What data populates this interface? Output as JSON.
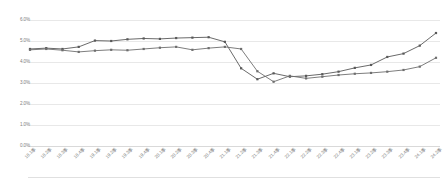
{
  "chart_data": {
    "type": "line",
    "title": "",
    "subtitle": "",
    "xlabel": "",
    "ylabel": "",
    "ylim": [
      0.0,
      6.0
    ],
    "yticks": [
      "6.0%",
      "5.0%",
      "4.0%",
      "3.0%",
      "2.0%",
      "1.0%",
      "0.0%"
    ],
    "ytick_values": [
      6.0,
      5.0,
      4.0,
      3.0,
      2.0,
      1.0,
      0.0
    ],
    "grid": true,
    "legend_position": "none",
    "categories": [
      "18.1季",
      "18.2季",
      "18.3季",
      "18.4季",
      "19.1季",
      "19.2季",
      "19.3季",
      "19.4季",
      "20.1季",
      "20.2季",
      "20.3季",
      "20.4季",
      "21.1季",
      "21.2季",
      "21.3季",
      "21.4季",
      "22.1季",
      "22.2季",
      "22.3季",
      "22.4季",
      "23.1季",
      "23.2季",
      "23.3季",
      "23.4季",
      "24.1季",
      "24.2季"
    ],
    "series": [
      {
        "name": "series-upper",
        "color": "#595959",
        "marker": "square",
        "values": [
          4.62,
          4.66,
          4.62,
          4.72,
          5.02,
          5.0,
          5.08,
          5.12,
          5.1,
          5.14,
          5.16,
          5.18,
          4.96,
          3.7,
          3.18,
          3.46,
          3.3,
          3.34,
          3.42,
          3.54,
          3.72,
          3.86,
          4.24,
          4.4,
          4.78,
          5.38
        ]
      },
      {
        "name": "series-lower",
        "color": "#6e6e6e",
        "marker": "square",
        "values": [
          4.58,
          4.62,
          4.56,
          4.48,
          4.54,
          4.58,
          4.56,
          4.62,
          4.68,
          4.72,
          4.58,
          4.66,
          4.72,
          4.62,
          3.56,
          3.06,
          3.34,
          3.22,
          3.3,
          3.38,
          3.44,
          3.48,
          3.54,
          3.62,
          3.78,
          4.2
        ]
      }
    ]
  }
}
